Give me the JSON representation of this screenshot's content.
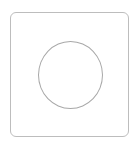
{
  "shapes": {
    "frame": {
      "type": "rounded-square",
      "stroke": "#bdbdbd",
      "fill": "#ffffff"
    },
    "circle": {
      "type": "circle",
      "stroke": "#a8a8a8",
      "fill": "none"
    }
  }
}
